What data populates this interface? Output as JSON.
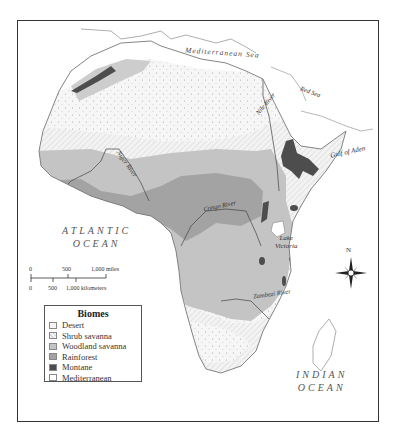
{
  "map": {
    "title": "Biomes of Africa",
    "oceans": [
      {
        "id": "atlantic",
        "line1": "ATLANTIC",
        "line2": "OCEAN"
      },
      {
        "id": "indian",
        "line1": "INDIAN",
        "line2": "OCEAN"
      }
    ],
    "seas": [
      {
        "id": "mediterranean",
        "label": "Mediterranean Sea"
      },
      {
        "id": "gulf-of-aden",
        "label": "Gulf of Aden"
      },
      {
        "id": "red-sea",
        "label": "Red Sea"
      }
    ],
    "rivers": [
      {
        "id": "nile",
        "label": "Nile River"
      },
      {
        "id": "niger",
        "label": "Niger River"
      },
      {
        "id": "congo",
        "label": "Congo River"
      },
      {
        "id": "zambezi",
        "label": "Zambezi River"
      }
    ],
    "lakes": [
      {
        "id": "victoria",
        "line1": "Lake",
        "line2": "Victoria"
      }
    ],
    "compass": {
      "north_label": "N"
    },
    "scale_bar": {
      "miles": {
        "ticks": [
          "0",
          "500",
          "1,000 miles"
        ]
      },
      "kilometers": {
        "ticks": [
          "0",
          "500",
          "1,000 kilometers"
        ]
      }
    }
  },
  "legend": {
    "title": "Biomes",
    "items": [
      {
        "label": "Desert",
        "color": "#f4f4f4",
        "pattern": "dots"
      },
      {
        "label": "Shrub savanna",
        "color": "#efefef",
        "pattern": "hatch"
      },
      {
        "label": "Woodland savanna",
        "color": "#c4c4c4",
        "pattern": "none"
      },
      {
        "label": "Rainforest",
        "color": "#a3a3a3",
        "pattern": "none"
      },
      {
        "label": "Montane",
        "color": "#4d4d4d",
        "pattern": "none"
      },
      {
        "label": "Mediterranean",
        "color": "#ffffff",
        "pattern": "none"
      }
    ]
  }
}
